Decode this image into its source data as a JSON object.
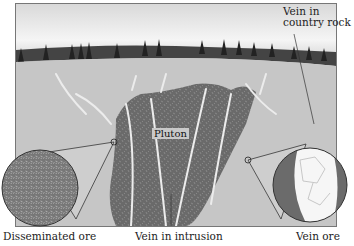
{
  "diagram": {
    "type": "geologic cross-section",
    "labels": {
      "vein_country_rock": "Vein in country rock",
      "vein_country_rock_line1": "Vein in",
      "vein_country_rock_line2": "country rock",
      "pluton": "Pluton",
      "disseminated_ore": "Disseminated ore",
      "vein_in_intrusion": "Vein in intrusion",
      "vein_ore": "Vein ore"
    },
    "colors": {
      "sky_top": "#f4f4f4",
      "tree_line": "#3a3a3a",
      "country_rock": "#c8c8c8",
      "pluton": "#6e6e6e",
      "veins": "#e6e6e6",
      "inset_disseminated": "#7a7a7a",
      "inset_vein_white": "#f6f6f6"
    }
  }
}
